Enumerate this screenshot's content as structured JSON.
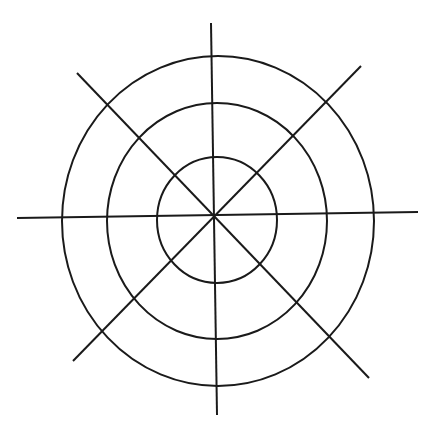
{
  "diagram": {
    "stroke_color": "#1a1a1a",
    "background": "#ffffff",
    "center": [
      214,
      217
    ],
    "circles": [
      {
        "cx": 217,
        "cy": 220,
        "rx": 60,
        "ry": 63
      },
      {
        "cx": 217,
        "cy": 221,
        "rx": 110,
        "ry": 118
      },
      {
        "cx": 218,
        "cy": 221,
        "rx": 156,
        "ry": 165
      }
    ],
    "lines": [
      {
        "name": "vertical",
        "x1": 211,
        "y1": 23,
        "x2": 217,
        "y2": 415
      },
      {
        "name": "horizontal",
        "x1": 17,
        "y1": 218,
        "x2": 418,
        "y2": 212
      },
      {
        "name": "diagonal-tl-br",
        "x1": 77,
        "y1": 73,
        "x2": 369,
        "y2": 378
      },
      {
        "name": "diagonal-tr-bl",
        "x1": 361,
        "y1": 66,
        "x2": 73,
        "y2": 361
      }
    ]
  }
}
